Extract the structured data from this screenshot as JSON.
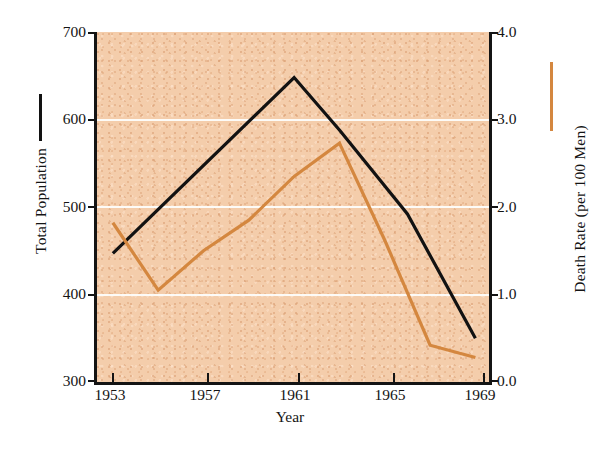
{
  "chart_data": {
    "type": "line",
    "title": "",
    "xlabel": "Year",
    "x": [
      1953,
      1954,
      1955,
      1956,
      1957,
      1958,
      1959,
      1960,
      1961,
      1962,
      1963,
      1964,
      1965,
      1966,
      1967,
      1968,
      1969
    ],
    "xlim": [
      1952.3,
      1969.6
    ],
    "xticks": [
      1953,
      1957,
      1961,
      1965,
      1969
    ],
    "xticklabels": [
      "1953",
      "1957",
      "1961",
      "1965",
      "1969"
    ],
    "grid": "horizontal-white",
    "legend_position": "axis-titles",
    "series": [
      {
        "name": "Total Population",
        "axis": "left",
        "color": "#121212",
        "ylabel": "Total Population",
        "ylim": [
          300,
          700
        ],
        "yticks": [
          300,
          400,
          500,
          600,
          700
        ],
        "yticklabels": [
          "300",
          "400",
          "500",
          "600",
          "700"
        ],
        "x": [
          1953,
          1961,
          1963,
          1966,
          1969
        ],
        "values": [
          447,
          648,
          588,
          492,
          350
        ]
      },
      {
        "name": "Death Rate (per 100 Men)",
        "axis": "right",
        "color": "#d4873f",
        "ylabel": "Death Rate (per 100 Men)",
        "ylim": [
          0.0,
          4.0
        ],
        "yticks": [
          0.0,
          1.0,
          2.0,
          3.0,
          4.0
        ],
        "yticklabels": [
          "0.0",
          "1.0",
          "2.0",
          "3.0",
          "4.0"
        ],
        "x": [
          1953,
          1955,
          1957,
          1959,
          1961,
          1963,
          1965,
          1967,
          1969
        ],
        "values": [
          1.82,
          1.05,
          1.5,
          1.85,
          2.35,
          2.73,
          1.62,
          0.42,
          0.28
        ]
      }
    ]
  },
  "axes": {
    "left_title": "Total Population",
    "right_title": "Death Rate (per 100 Men)",
    "bottom_title": "Year",
    "left_ticks": [
      "700",
      "600",
      "500",
      "400",
      "300"
    ],
    "right_ticks": [
      "4.0",
      "3.0",
      "2.0",
      "1.0",
      "0.0"
    ],
    "bottom_ticks": [
      "1953",
      "1957",
      "1961",
      "1965",
      "1969"
    ]
  },
  "colors": {
    "population_line": "#121212",
    "death_rate_line": "#d4873f",
    "plot_background": "#f4cdab",
    "gridline": "#fdfdfb",
    "axis": "#141414"
  }
}
